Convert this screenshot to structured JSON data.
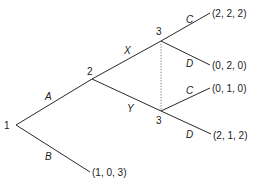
{
  "nodes": [
    {
      "id": "n1",
      "label": "1",
      "x": 16,
      "y": 125
    },
    {
      "id": "n2",
      "label": "2",
      "x": 92,
      "y": 79
    },
    {
      "id": "n3a",
      "label": "3",
      "x": 161,
      "y": 41
    },
    {
      "id": "n3b",
      "label": "3",
      "x": 161,
      "y": 111
    }
  ],
  "edges": [
    {
      "from": "n1",
      "to": "n2",
      "action": "A"
    },
    {
      "from": "n1",
      "to": "tB",
      "action": "B"
    },
    {
      "from": "n2",
      "to": "n3a",
      "action": "X"
    },
    {
      "from": "n2",
      "to": "n3b",
      "action": "Y"
    },
    {
      "from": "n3a",
      "to": "t1",
      "action": "C"
    },
    {
      "from": "n3a",
      "to": "t2",
      "action": "D"
    },
    {
      "from": "n3b",
      "to": "t3",
      "action": "C"
    },
    {
      "from": "n3b",
      "to": "t4",
      "action": "D"
    }
  ],
  "terminals": [
    {
      "id": "t1",
      "payoff": "(2, 2, 2)"
    },
    {
      "id": "t2",
      "payoff": "(0, 2, 0)"
    },
    {
      "id": "t3",
      "payoff": "(0, 1, 0)"
    },
    {
      "id": "t4",
      "payoff": "(2, 1, 2)"
    },
    {
      "id": "tB",
      "payoff": "(1, 0, 3)"
    }
  ],
  "information_set": {
    "nodes": [
      "n3a",
      "n3b"
    ],
    "style": "dotted"
  }
}
